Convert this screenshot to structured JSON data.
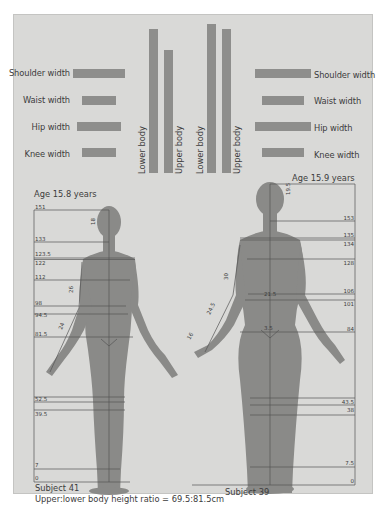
{
  "left_subject": {
    "name": "Subject 41",
    "age_label": "Age 15.8 years",
    "ratio_label": "Upper:lower body height ratio = 69.5:81.5cm",
    "bars": [
      {
        "label": "Shoulder width",
        "width": 52
      },
      {
        "label": "Waist width",
        "width": 34
      },
      {
        "label": "Hip width",
        "width": 44
      },
      {
        "label": "Knee width",
        "width": 34
      }
    ],
    "vertical_bars": [
      {
        "label": "Lower body",
        "height": 144
      },
      {
        "label": "Upper body",
        "height": 123
      }
    ],
    "scale_labels": [
      "151",
      "133",
      "123.5",
      "122",
      "112",
      "98",
      "94.5",
      "81.5",
      "52.5",
      "39.5",
      "7",
      "0"
    ],
    "segment_labels": [
      "18",
      "26",
      "24",
      "5.5",
      "2.5",
      "1.5",
      "1.5",
      "4.2"
    ]
  },
  "right_subject": {
    "name": "Subject 39",
    "age_label": "Age 15.9 years",
    "bars": [
      {
        "label": "Shoulder width",
        "width": 56
      },
      {
        "label": "Waist width",
        "width": 42
      },
      {
        "label": "Hip width",
        "width": 56
      },
      {
        "label": "Knee width",
        "width": 42
      }
    ],
    "vertical_bars": [
      {
        "label": "Lower body",
        "height": 149
      },
      {
        "label": "Upper body",
        "height": 144
      }
    ],
    "scale_labels": [
      "153",
      "135",
      "134",
      "128",
      "106",
      "101",
      "84",
      "43.5",
      "38",
      "7.5",
      "0"
    ],
    "segment_labels": [
      "19.5",
      "30",
      "24.5",
      "16",
      "21.5",
      "3.5",
      "1.5"
    ]
  },
  "colors": {
    "panel_bg": "#d9d9d7",
    "bar": "#8e8e8c",
    "figure": "#8a8a88",
    "text": "#3c3c3c",
    "line": "#555555"
  }
}
